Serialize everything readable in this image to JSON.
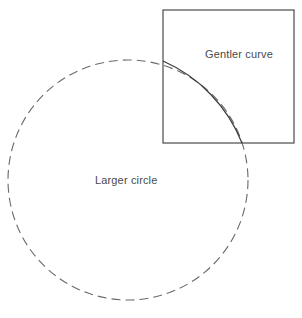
{
  "figure": {
    "title": "",
    "background_color": "#ffffff",
    "width": 302,
    "height": 318,
    "stroke_color": "#4a4a4a",
    "text_color": "#4a4a4a",
    "labels": {
      "gentler_curve": "Gentler curve",
      "larger_circle": "Larger circle"
    },
    "shapes": {
      "square": {
        "name": "square-frame",
        "x": 163,
        "y": 10,
        "width": 131,
        "height": 133,
        "stroke": "#4a4a4a",
        "stroke_width": 1.2,
        "fill": "none"
      },
      "dashed_circle": {
        "name": "larger-circle",
        "cx": 128,
        "cy": 180,
        "r": 120,
        "stroke": "#6a6a6a",
        "stroke_width": 1.1,
        "fill": "none",
        "dash_pattern": "9 5"
      },
      "arc": {
        "name": "gentler-arc",
        "start_x": 163,
        "start_y": 61,
        "end_x": 242,
        "end_y": 143,
        "radius": 150,
        "sweep": 1,
        "large_arc": 0,
        "stroke": "#3a3a3a",
        "stroke_width": 1.2,
        "fill": "none"
      }
    },
    "label_positions": {
      "gentler_curve": {
        "x": 205,
        "y": 58
      },
      "larger_circle": {
        "x": 95,
        "y": 184
      }
    }
  }
}
